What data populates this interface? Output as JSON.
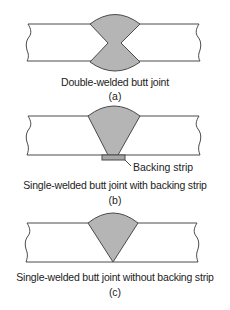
{
  "colors": {
    "weld_fill": "#b5b5b5",
    "stroke": "#4a4a4a",
    "backing_fill": "#a8a8a8",
    "background": "#ffffff"
  },
  "figures": [
    {
      "id": "a",
      "caption": "Double-welded butt joint",
      "label": "(a)",
      "weld_type": "double-V"
    },
    {
      "id": "b",
      "caption": "Single-welded butt joint with backing strip",
      "label": "(b)",
      "weld_type": "single-V",
      "callout": "Backing strip"
    },
    {
      "id": "c",
      "caption": "Single-welded butt joint without backing strip",
      "label": "(c)",
      "weld_type": "single-V"
    }
  ]
}
